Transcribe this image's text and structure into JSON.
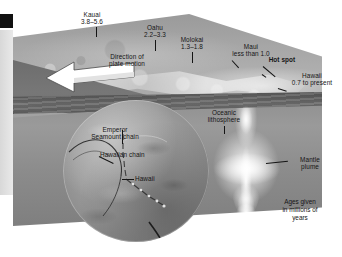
{
  "figure": {
    "type": "block-diagram",
    "caption_lines": [
      "Ages given",
      "in millions of",
      "years"
    ]
  },
  "islands": [
    {
      "name": "Kauai",
      "age_range": "3.8–5.6",
      "age_min": 3.8,
      "age_max": 5.6
    },
    {
      "name": "Oahu",
      "age_range": "2.2–3.3",
      "age_min": 2.2,
      "age_max": 3.3
    },
    {
      "name": "Molokai",
      "age_range": "1.3–1.8",
      "age_min": 1.3,
      "age_max": 1.8
    },
    {
      "name": "Maui",
      "age_range": "less than 1.0",
      "age_min": 0.0,
      "age_max": 1.0
    },
    {
      "name": "Hawaii",
      "age_range": "0.7 to present",
      "age_min": 0.0,
      "age_max": 0.7
    }
  ],
  "labels": {
    "kauai_name": "Kauai",
    "kauai_age": "3.8–5.6",
    "oahu_name": "Oahu",
    "oahu_age": "2.2–3.3",
    "molokai_name": "Molokai",
    "molokai_age": "1.3–1.8",
    "maui_name": "Maui",
    "maui_age": "less than 1.0",
    "hotspot": "Hot spot",
    "hawaii_name": "Hawaii",
    "hawaii_age": "0.7 to present",
    "plate_motion_1": "Direction of",
    "plate_motion_2": "plate motion",
    "lithosphere_1": "Oceanic",
    "lithosphere_2": "lithosphere",
    "plume_1": "Mantle",
    "plume_2": "plume",
    "emperor_1": "Emperor",
    "emperor_2": "Seamount chain",
    "hawaiian_chain": "Hawaiian chain",
    "globe_hawaii": "Hawaii"
  },
  "caption": {
    "line1": "Ages given",
    "line2": "in millions of",
    "line3": "years"
  },
  "colors": {
    "background": "#ffffff",
    "text": "#151515",
    "block_top": "#a6a6a6",
    "block_side": "#6d6d6d",
    "mantle": "#8e8e8e",
    "lithosphere": "#4f4f4f",
    "plume_glow": "#ffffff",
    "arrow_fill": "#ffffff",
    "arrow_stroke": "#3a3a3a",
    "globe": "#9a9a9a",
    "margin_mark": "#111111",
    "margin_bar": "#d8d8d8"
  }
}
